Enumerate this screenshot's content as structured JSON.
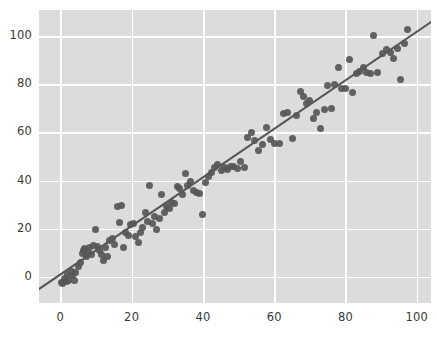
{
  "chart_data": {
    "type": "scatter",
    "title": "",
    "xlabel": "",
    "ylabel": "",
    "xlim": [
      -6,
      104
    ],
    "ylim": [
      -11,
      111
    ],
    "xticks": [
      0,
      20,
      40,
      60,
      80,
      100
    ],
    "yticks": [
      0,
      20,
      40,
      60,
      80,
      100
    ],
    "xtick_labels": [
      "0",
      "20",
      "40",
      "60",
      "80",
      "100"
    ],
    "ytick_labels": [
      "0",
      "20",
      "40",
      "60",
      "80",
      "100"
    ],
    "grid": true,
    "grid_color": "#ffffff",
    "axes_facecolor": "#dcdcdc",
    "figure_facecolor": "#ffffff",
    "legend": null,
    "marker_color": "#565656",
    "marker_size": 7,
    "series": [
      {
        "name": "observations",
        "x": [
          0.2,
          0.7,
          1.1,
          1.6,
          2.0,
          2.4,
          3.1,
          3.4,
          3.9,
          4.3,
          5.0,
          5.6,
          6.1,
          6.4,
          6.8,
          7.2,
          7.6,
          8.1,
          8.6,
          9.2,
          9.8,
          10.4,
          10.9,
          11.4,
          12.0,
          12.6,
          13.2,
          13.9,
          14.6,
          15.2,
          15.9,
          16.5,
          17.2,
          17.8,
          18.4,
          19.1,
          19.8,
          20.5,
          21.2,
          21.8,
          22.4,
          23.1,
          23.8,
          24.4,
          25.1,
          25.8,
          26.4,
          27.1,
          27.8,
          28.5,
          29.2,
          29.9,
          30.6,
          31.3,
          32.0,
          32.8,
          33.5,
          34.2,
          35.0,
          35.8,
          36.6,
          37.4,
          38.2,
          39.0,
          39.8,
          40.6,
          41.5,
          42.4,
          43.3,
          44.2,
          45.1,
          46.0,
          46.9,
          47.8,
          48.7,
          49.6,
          50.6,
          51.6,
          52.6,
          53.6,
          54.6,
          55.7,
          56.8,
          57.9,
          59.0,
          60.2,
          61.4,
          62.6,
          63.8,
          65.0,
          66.2,
          67.5,
          68.2,
          69.0,
          70.0,
          71.0,
          72.0,
          73.0,
          74.0,
          75.0,
          76.0,
          77.0,
          78.0,
          79.0,
          80.0,
          81.0,
          82.0,
          83.0,
          84.0,
          85.0,
          86.0,
          87.0,
          88.0,
          89.0,
          90.5,
          91.5,
          92.5,
          93.5,
          94.5,
          95.5,
          96.5,
          97.5
        ],
        "y": [
          -2.5,
          -3.0,
          -1.0,
          -2.2,
          1.0,
          -1.5,
          2.0,
          0.5,
          -1.8,
          1.5,
          4.0,
          6.0,
          9.5,
          11.0,
          11.5,
          8.5,
          10.5,
          12.0,
          9.0,
          13.0,
          19.5,
          12.5,
          11.0,
          9.0,
          6.5,
          12.0,
          8.5,
          15.0,
          16.0,
          13.5,
          29.0,
          22.5,
          29.5,
          12.0,
          18.5,
          17.0,
          21.5,
          22.0,
          16.5,
          14.0,
          18.5,
          20.5,
          26.5,
          23.0,
          38.0,
          22.0,
          25.0,
          19.5,
          24.0,
          34.0,
          26.5,
          29.0,
          28.5,
          31.0,
          30.5,
          37.5,
          36.5,
          34.0,
          43.0,
          38.0,
          39.5,
          36.0,
          35.0,
          34.5,
          26.0,
          39.0,
          41.5,
          43.5,
          45.5,
          46.5,
          44.0,
          45.5,
          44.5,
          46.0,
          46.0,
          45.0,
          48.0,
          45.5,
          58.0,
          60.0,
          56.5,
          52.5,
          55.0,
          62.0,
          57.0,
          55.5,
          55.5,
          68.0,
          68.5,
          57.5,
          67.0,
          77.0,
          75.0,
          72.0,
          73.5,
          66.0,
          68.5,
          61.5,
          69.5,
          79.5,
          70.0,
          80.0,
          87.0,
          78.5,
          78.5,
          90.5,
          76.5,
          84.5,
          85.5,
          87.0,
          85.0,
          84.5,
          100.5,
          85.0,
          93.0,
          94.5,
          93.5,
          91.0,
          95.0,
          82.0,
          97.0,
          103.0
        ]
      }
    ],
    "trendline": {
      "type": "linear-regression",
      "color": "#565656",
      "linewidth": 2,
      "x0": -6,
      "y0": -5.2,
      "x1": 104,
      "y1": 106.0
    }
  }
}
